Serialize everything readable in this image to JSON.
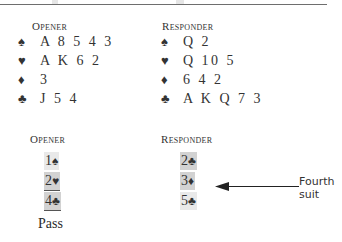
{
  "hands": {
    "opener": {
      "heading": "Opener",
      "rows": [
        {
          "suit": "spades",
          "symbol": "♠",
          "cards": "A 8 5 4 3"
        },
        {
          "suit": "hearts",
          "symbol": "♥",
          "cards": "A K 6 2"
        },
        {
          "suit": "diamonds",
          "symbol": "♦",
          "cards": "3"
        },
        {
          "suit": "clubs",
          "symbol": "♣",
          "cards": "J 5 4"
        }
      ]
    },
    "responder": {
      "heading": "Responder",
      "rows": [
        {
          "suit": "spades",
          "symbol": "♠",
          "cards": "Q 2"
        },
        {
          "suit": "hearts",
          "symbol": "♥",
          "cards": "Q 10 5"
        },
        {
          "suit": "diamonds",
          "symbol": "♦",
          "cards": "6 4 2"
        },
        {
          "suit": "clubs",
          "symbol": "♣",
          "cards": "A K Q 7 3"
        }
      ]
    }
  },
  "auction": {
    "opener": {
      "heading": "Opener",
      "bids": [
        {
          "level": "1",
          "symbol": "♠"
        },
        {
          "level": "2",
          "symbol": "♥"
        },
        {
          "level": "4",
          "symbol": "♣"
        }
      ],
      "final": "Pass"
    },
    "responder": {
      "heading": "Responder",
      "bids": [
        {
          "level": "2",
          "symbol": "♣"
        },
        {
          "level": "3",
          "symbol": "♦"
        },
        {
          "level": "5",
          "symbol": "♣"
        }
      ]
    }
  },
  "annotation": {
    "label": "Fourth suit",
    "points_to": "3♦"
  }
}
